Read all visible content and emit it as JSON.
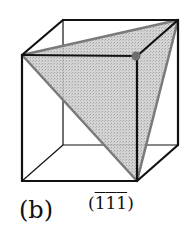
{
  "figure": {
    "panel_label": "(b)",
    "plane_label": {
      "open": "(",
      "indices": [
        "1",
        "1",
        "1"
      ],
      "negated": [
        true,
        true,
        true
      ],
      "close": ")"
    },
    "colors": {
      "edge": "#111111",
      "plane_fill": "#c8c8c8",
      "plane_edge": "#7a7a7a",
      "dot": "#6e6e6e",
      "background": "#ffffff"
    },
    "cube_vertices": {
      "front_top_left": [
        22,
        55
      ],
      "front_top_right": [
        137,
        56
      ],
      "front_bottom_left": [
        22,
        181
      ],
      "front_bottom_right": [
        137,
        181
      ],
      "back_top_left": [
        63,
        20
      ],
      "back_top_right": [
        178,
        20
      ],
      "back_bottom_left": [
        63,
        145
      ],
      "back_bottom_right": [
        178,
        145
      ]
    },
    "plane_vertices": [
      "front_top_left",
      "back_top_right",
      "front_bottom_right"
    ],
    "marked_corner": "front_top_right"
  }
}
